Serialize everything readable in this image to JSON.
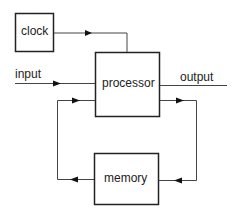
{
  "diagram": {
    "nodes": {
      "clock": "clock",
      "processor": "processor",
      "memory": "memory"
    },
    "edges": {
      "input": "input",
      "output": "output"
    },
    "colors": {
      "line": "#333333",
      "box_border": "#222222",
      "background": "#ffffff"
    }
  }
}
